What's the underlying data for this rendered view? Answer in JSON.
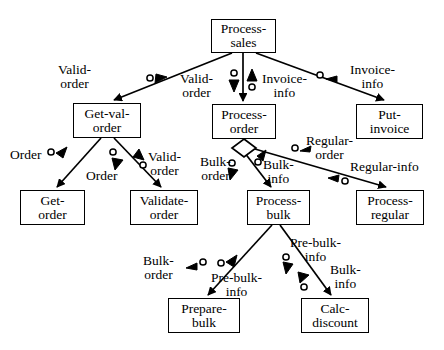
{
  "diagram": {
    "type": "structure-chart",
    "stroke_color": "#000000",
    "background_color": "#ffffff",
    "nodes": [
      {
        "id": "process-sales",
        "lines": [
          "Process-",
          "sales"
        ],
        "x": 211,
        "y": 19,
        "w": 65,
        "h": 34
      },
      {
        "id": "get-val-order",
        "lines": [
          "Get-val-",
          "order"
        ],
        "x": 73,
        "y": 103,
        "w": 68,
        "h": 35
      },
      {
        "id": "process-order",
        "lines": [
          "Process-",
          "order"
        ],
        "x": 212,
        "y": 104,
        "w": 64,
        "h": 35
      },
      {
        "id": "put-invoice",
        "lines": [
          "Put-",
          "invoice"
        ],
        "x": 356,
        "y": 104,
        "w": 67,
        "h": 35
      },
      {
        "id": "get-order",
        "lines": [
          "Get-",
          "order"
        ],
        "x": 20,
        "y": 190,
        "w": 65,
        "h": 35
      },
      {
        "id": "validate-order",
        "lines": [
          "Validate-",
          "order"
        ],
        "x": 130,
        "y": 190,
        "w": 68,
        "h": 35
      },
      {
        "id": "process-bulk",
        "lines": [
          "Process-",
          "bulk"
        ],
        "x": 247,
        "y": 190,
        "w": 63,
        "h": 35
      },
      {
        "id": "process-regular",
        "lines": [
          "Process-",
          "regular"
        ],
        "x": 356,
        "y": 190,
        "w": 68,
        "h": 35
      },
      {
        "id": "prepare-bulk",
        "lines": [
          "Prepare-",
          "bulk"
        ],
        "x": 168,
        "y": 298,
        "w": 72,
        "h": 35
      },
      {
        "id": "calc-discount",
        "lines": [
          "Calc-",
          "discount"
        ],
        "x": 301,
        "y": 298,
        "w": 68,
        "h": 35
      }
    ],
    "flow_labels": [
      {
        "id": "valid-order-left",
        "lines": [
          "Valid-",
          "order"
        ],
        "x": 58,
        "y": 63,
        "align": "left"
      },
      {
        "id": "valid-order-center",
        "lines": [
          "Valid-",
          "order"
        ],
        "x": 182,
        "y": 72,
        "align": "left"
      },
      {
        "id": "invoice-info-center",
        "lines": [
          "Invoice-",
          "info"
        ],
        "x": 260,
        "y": 72,
        "align": "left"
      },
      {
        "id": "invoice-info-right",
        "lines": [
          "Invoice-",
          "info"
        ],
        "x": 352,
        "y": 63,
        "align": "left"
      },
      {
        "id": "order-left",
        "lines": [
          "Order"
        ],
        "x": 15,
        "y": 159,
        "align": "left"
      },
      {
        "id": "order-center",
        "lines": [
          "Order"
        ],
        "x": 91,
        "y": 170,
        "align": "left"
      },
      {
        "id": "valid-order-lower",
        "lines": [
          "Valid-",
          "order"
        ],
        "x": 146,
        "y": 155,
        "align": "left"
      },
      {
        "id": "bulk-order-mid",
        "lines": [
          "Bulk-",
          "order"
        ],
        "x": 206,
        "y": 155,
        "align": "left"
      },
      {
        "id": "bulk-info-mid",
        "lines": [
          "Bulk-",
          "info"
        ],
        "x": 264,
        "y": 161,
        "align": "left"
      },
      {
        "id": "regular-order",
        "lines": [
          "Regular-",
          "order"
        ],
        "x": 305,
        "y": 134,
        "align": "left"
      },
      {
        "id": "regular-info",
        "lines": [
          "Regular-info"
        ],
        "x": 340,
        "y": 167,
        "align": "left"
      },
      {
        "id": "bulk-order-low",
        "lines": [
          "Bulk-",
          "order"
        ],
        "x": 148,
        "y": 255,
        "align": "left"
      },
      {
        "id": "pre-bulk-info-low",
        "lines": [
          "Pre-bulk-",
          "info"
        ],
        "x": 218,
        "y": 272,
        "align": "left"
      },
      {
        "id": "pre-bulk-info-up",
        "lines": [
          "Pre-bulk-",
          "info"
        ],
        "x": 292,
        "y": 238,
        "align": "left"
      },
      {
        "id": "bulk-info-low",
        "lines": [
          "Bulk-",
          "info"
        ],
        "x": 331,
        "y": 265,
        "align": "left"
      }
    ],
    "edges": [
      {
        "id": "sales-to-getval",
        "from": "process-sales",
        "to": "get-val-order",
        "x1": 232,
        "y1": 53,
        "x2": 113,
        "y2": 101
      },
      {
        "id": "sales-to-order",
        "from": "process-sales",
        "to": "process-order",
        "x1": 243,
        "y1": 53,
        "x2": 243,
        "y2": 102
      },
      {
        "id": "sales-to-invoice",
        "from": "process-sales",
        "to": "put-invoice",
        "x1": 256,
        "y1": 53,
        "x2": 384,
        "y2": 101
      },
      {
        "id": "getval-to-get",
        "from": "get-val-order",
        "to": "get-order",
        "x1": 100,
        "y1": 138,
        "x2": 57,
        "y2": 188
      },
      {
        "id": "getval-to-validate",
        "from": "get-val-order",
        "to": "validate-order",
        "x1": 114,
        "y1": 138,
        "x2": 161,
        "y2": 188
      },
      {
        "id": "order-to-bulk",
        "from": "process-order",
        "to": "process-bulk",
        "x1": 241,
        "y1": 148,
        "x2": 271,
        "y2": 188
      },
      {
        "id": "order-to-regular",
        "from": "process-order",
        "to": "process-regular",
        "x1": 243,
        "y1": 145,
        "x2": 385,
        "y2": 188
      },
      {
        "id": "bulk-to-prepare",
        "from": "process-bulk",
        "to": "prepare-bulk",
        "x1": 272,
        "y1": 225,
        "x2": 207,
        "y2": 296
      },
      {
        "id": "bulk-to-calc",
        "from": "process-bulk",
        "to": "calc-discount",
        "x1": 280,
        "y1": 225,
        "x2": 330,
        "y2": 296
      }
    ],
    "markers": [
      {
        "id": "m-valid-order-left",
        "kind": "circle-then-triangle",
        "note": "data flow down-left toward Get-val-order"
      },
      {
        "id": "m-valid-order-down",
        "kind": "circle-above-triangle-down",
        "note": "valid-order into Process-order"
      },
      {
        "id": "m-invoice-info-up",
        "kind": "triangle-up-above-circle",
        "note": "invoice-info out of Process-order"
      },
      {
        "id": "m-invoice-info-right",
        "kind": "circle-then-triangle",
        "note": "invoice-info toward Put-invoice"
      },
      {
        "id": "m-order-down",
        "kind": "circle-then-triangle",
        "note": "order toward Get-order"
      },
      {
        "id": "m-order-return",
        "kind": "circle-above-triangle-down",
        "note": "order returned"
      },
      {
        "id": "m-valid-order-return",
        "kind": "triangle-up-above-circle",
        "note": "valid-order returned"
      },
      {
        "id": "m-bulk-order",
        "kind": "circle-then-triangle",
        "note": "bulk-order down"
      },
      {
        "id": "m-bulk-info",
        "kind": "circle-then-triangle",
        "note": "bulk-info up"
      },
      {
        "id": "m-regular-order",
        "kind": "circle-then-triangle",
        "note": "regular-order"
      },
      {
        "id": "m-regular-info",
        "kind": "triangle-then-circle",
        "note": "regular-info back"
      },
      {
        "id": "m-bulk-order-low",
        "kind": "triangle-then-circle",
        "note": "bulk-order to Prepare-bulk"
      },
      {
        "id": "m-pre-bulk-info-low",
        "kind": "circle-then-triangle",
        "note": "pre-bulk-info up"
      },
      {
        "id": "m-pre-bulk-info-up",
        "kind": "circle-then-triangle",
        "note": "pre-bulk-info down"
      },
      {
        "id": "m-bulk-info-low",
        "kind": "triangle-then-circle",
        "note": "bulk-info back"
      }
    ]
  }
}
